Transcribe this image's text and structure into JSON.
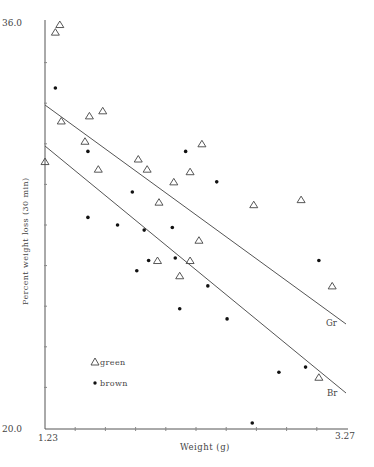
{
  "chart_data": {
    "type": "scatter",
    "title": "",
    "xlabel": "Weight (g)",
    "ylabel": "Percent weight loss (30 min)",
    "xlim": [
      1.23,
      3.27
    ],
    "ylim": [
      20.0,
      36.0
    ],
    "x_tick_labels": [
      "1.23",
      "3.27"
    ],
    "y_tick_labels": [
      "20.0",
      "36.0"
    ],
    "grid": false,
    "legend": {
      "position": "lower-left",
      "entries": [
        {
          "marker": "triangle",
          "label": "green"
        },
        {
          "marker": "dot",
          "label": "brown"
        }
      ]
    },
    "series": [
      {
        "name": "green",
        "marker": "triangle",
        "points": [
          [
            1.33,
            35.9
          ],
          [
            1.3,
            35.6
          ],
          [
            1.23,
            30.5
          ],
          [
            1.34,
            32.1
          ],
          [
            1.53,
            32.3
          ],
          [
            1.62,
            32.5
          ],
          [
            1.5,
            31.3
          ],
          [
            1.59,
            30.2
          ],
          [
            1.86,
            30.6
          ],
          [
            1.92,
            30.2
          ],
          [
            2.1,
            29.7
          ],
          [
            2.29,
            31.2
          ],
          [
            2.21,
            30.1
          ],
          [
            2.0,
            28.9
          ],
          [
            2.64,
            28.8
          ],
          [
            2.27,
            27.4
          ],
          [
            1.99,
            26.6
          ],
          [
            2.21,
            26.6
          ],
          [
            2.14,
            26.0
          ],
          [
            2.96,
            29.0
          ],
          [
            3.17,
            25.6
          ],
          [
            3.08,
            22.0
          ]
        ]
      },
      {
        "name": "brown",
        "marker": "dot",
        "points": [
          [
            1.3,
            33.4
          ],
          [
            1.52,
            30.9
          ],
          [
            1.82,
            29.3
          ],
          [
            1.52,
            28.3
          ],
          [
            1.72,
            28.0
          ],
          [
            1.9,
            27.8
          ],
          [
            2.09,
            27.9
          ],
          [
            2.11,
            26.7
          ],
          [
            1.85,
            26.2
          ],
          [
            1.93,
            26.6
          ],
          [
            2.18,
            30.9
          ],
          [
            2.39,
            29.7
          ],
          [
            2.33,
            25.6
          ],
          [
            2.14,
            24.7
          ],
          [
            2.46,
            24.3
          ],
          [
            2.63,
            20.2
          ],
          [
            2.81,
            22.2
          ],
          [
            2.99,
            22.4
          ],
          [
            3.08,
            26.6
          ]
        ]
      }
    ],
    "regression_lines": [
      {
        "name": "green",
        "label": "Gr",
        "x": [
          1.23,
          3.27
        ],
        "y": [
          32.7,
          24.1
        ]
      },
      {
        "name": "brown",
        "label": "Br",
        "x": [
          1.23,
          3.27
        ],
        "y": [
          31.1,
          21.4
        ]
      }
    ]
  },
  "axes": {
    "xlabel": "Weight (g)",
    "ylabel": "Percent weight loss (30 min)",
    "xmin_label": "1.23",
    "xmax_label": "3.27",
    "ymin_label": "20.0",
    "ymax_label": "36.0"
  },
  "legend": {
    "green_label": "green",
    "brown_label": "brown"
  },
  "line_labels": {
    "green": "Gr",
    "brown": "Br"
  }
}
